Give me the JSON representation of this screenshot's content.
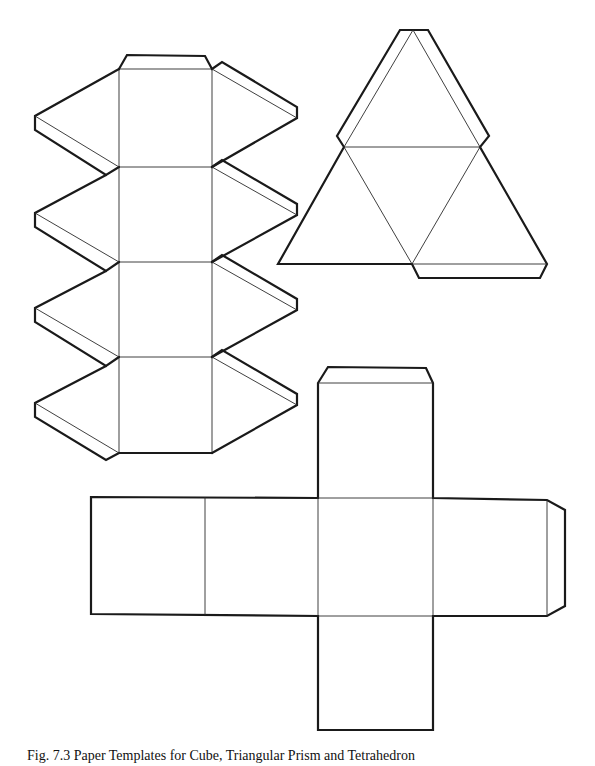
{
  "figure": {
    "caption": "Fig. 7.3 Paper Templates for Cube, Triangular Prism and Tetrahedron",
    "caption_note": "caption is partially cut off at the bottom edge of the image",
    "stroke_color": "#1a1a1a",
    "background": "#ffffff"
  },
  "nets": [
    {
      "id": "triangular-prism-net",
      "label": "prism net (upper left)",
      "faces": 4,
      "tabs": 9
    },
    {
      "id": "tetrahedron-net",
      "label": "tetrahedron net (upper right)",
      "faces": 4,
      "tabs": 3
    },
    {
      "id": "cube-net",
      "label": "cube net (bottom)",
      "faces": 6,
      "tabs": 2
    }
  ]
}
